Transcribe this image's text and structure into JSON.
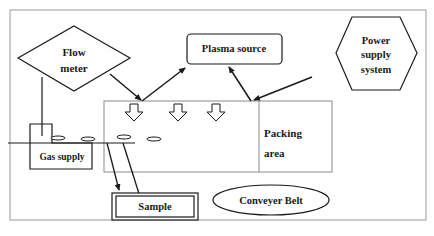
{
  "diagram": {
    "type": "process-schematic",
    "nodes": {
      "flow_meter": {
        "line1": "Flow",
        "line2": "meter",
        "shape": "diamond"
      },
      "plasma_source": {
        "label": "Plasma source",
        "shape": "rounded-rectangle"
      },
      "power_supply": {
        "line1": "Power",
        "line2": "supply",
        "line3": "system",
        "shape": "hexagon"
      },
      "packing_area": {
        "line1": "Packing",
        "line2": "area",
        "shape": "rectangle"
      },
      "gas_supply": {
        "label": "Gas supply",
        "shape": "rectangle"
      },
      "sample": {
        "label": "Sample",
        "shape": "double-rectangle"
      },
      "conveyer_belt": {
        "label": "Conveyer Belt",
        "shape": "ellipse"
      }
    },
    "edges": [
      {
        "from": "flow_meter",
        "to": "packing_chamber"
      },
      {
        "from": "packing_chamber",
        "to": "plasma_source"
      },
      {
        "from": "power_supply",
        "to": "packing_chamber"
      },
      {
        "from": "gas_line",
        "to": "sample"
      },
      {
        "from": "gas_supply",
        "to": "flow_meter"
      }
    ],
    "colors": {
      "stroke": "#1a1a1a",
      "frame": "#9a9a9a",
      "background": "#ffffff"
    }
  }
}
